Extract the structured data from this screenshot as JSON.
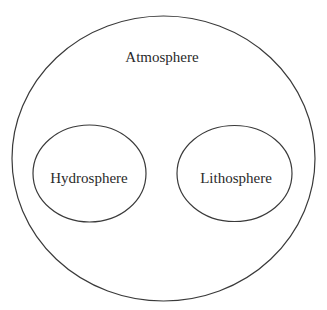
{
  "diagram": {
    "type": "nested-ellipses",
    "colors": {
      "stroke": "#3a3a3a",
      "text": "#2a2a2a",
      "background": "#ffffff"
    },
    "outer": {
      "label": "Atmosphere",
      "cx": 163.5,
      "cy": 158.5,
      "rx": 151.5,
      "ry": 142.5
    },
    "inner": [
      {
        "label": "Hydrosphere",
        "cx": 89.5,
        "cy": 173.5,
        "rx": 56.5,
        "ry": 48.5
      },
      {
        "label": "Lithosphere",
        "cx": 234.5,
        "cy": 173.5,
        "rx": 57.5,
        "ry": 48
      }
    ]
  }
}
